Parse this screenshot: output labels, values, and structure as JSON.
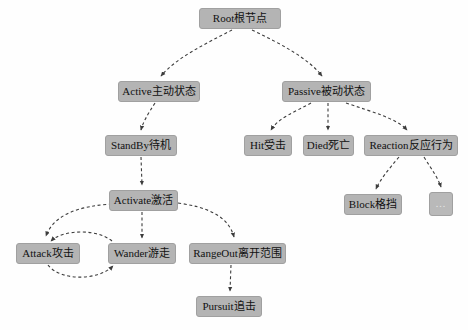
{
  "diagram": {
    "background_color": "#fefefe",
    "node_fill_color": "#b4b4b4",
    "node_border_color": "#a0a0a0",
    "node_text_color": "#111111",
    "edge_color": "#3c3c3c",
    "edge_style": "dashed",
    "arrowhead": "solid-triangle",
    "nodes": [
      {
        "id": "root",
        "label": "Root根节点",
        "x": 199,
        "y": 8,
        "w": 82,
        "h": 21
      },
      {
        "id": "active",
        "label": "Active主动状态",
        "x": 118,
        "y": 81,
        "w": 82,
        "h": 21
      },
      {
        "id": "passive",
        "label": "Passive被动状态",
        "x": 282,
        "y": 81,
        "w": 89,
        "h": 21
      },
      {
        "id": "standby",
        "label": "StandBy待机",
        "x": 105,
        "y": 135,
        "w": 72,
        "h": 21
      },
      {
        "id": "hit",
        "label": "Hit受击",
        "x": 244,
        "y": 135,
        "w": 48,
        "h": 21
      },
      {
        "id": "died",
        "label": "Died死亡",
        "x": 303,
        "y": 135,
        "w": 51,
        "h": 21
      },
      {
        "id": "reaction",
        "label": "Reaction反应行为",
        "x": 364,
        "y": 135,
        "w": 94,
        "h": 21
      },
      {
        "id": "activate",
        "label": "Activate激活",
        "x": 109,
        "y": 190,
        "w": 69,
        "h": 21
      },
      {
        "id": "block",
        "label": "Block格挡",
        "x": 344,
        "y": 194,
        "w": 58,
        "h": 21
      },
      {
        "id": "more",
        "label": "...",
        "x": 429,
        "y": 192,
        "w": 24,
        "h": 24
      },
      {
        "id": "attack",
        "label": "Attack攻击",
        "x": 16,
        "y": 243,
        "w": 64,
        "h": 21
      },
      {
        "id": "wander",
        "label": "Wander游走",
        "x": 108,
        "y": 243,
        "w": 68,
        "h": 21
      },
      {
        "id": "rangeout",
        "label": "RangeOut离开范围",
        "x": 189,
        "y": 243,
        "w": 97,
        "h": 21
      },
      {
        "id": "pursuit",
        "label": "Pursuit追击",
        "x": 196,
        "y": 296,
        "w": 66,
        "h": 21
      }
    ],
    "edges": [
      {
        "from": "root",
        "to": "active",
        "kind": "curve"
      },
      {
        "from": "root",
        "to": "passive",
        "kind": "curve"
      },
      {
        "from": "active",
        "to": "standby",
        "kind": "curve"
      },
      {
        "from": "standby",
        "to": "activate",
        "kind": "straight"
      },
      {
        "from": "activate",
        "to": "attack",
        "kind": "curve"
      },
      {
        "from": "activate",
        "to": "wander",
        "kind": "straight"
      },
      {
        "from": "activate",
        "to": "rangeout",
        "kind": "curve"
      },
      {
        "from": "attack",
        "to": "wander",
        "kind": "loop-bottom"
      },
      {
        "from": "wander",
        "to": "attack",
        "kind": "loop-top"
      },
      {
        "from": "rangeout",
        "to": "pursuit",
        "kind": "straight"
      },
      {
        "from": "passive",
        "to": "hit",
        "kind": "curve"
      },
      {
        "from": "passive",
        "to": "died",
        "kind": "straight"
      },
      {
        "from": "passive",
        "to": "reaction",
        "kind": "curve"
      },
      {
        "from": "reaction",
        "to": "block",
        "kind": "curve"
      },
      {
        "from": "reaction",
        "to": "more",
        "kind": "curve"
      }
    ]
  }
}
